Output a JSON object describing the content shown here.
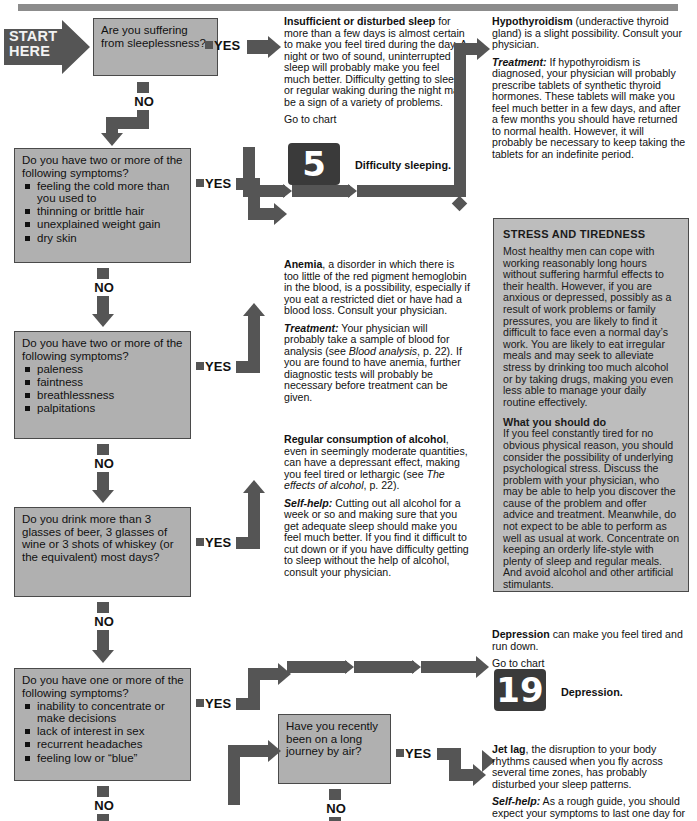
{
  "meta": {
    "chart_title": "Tiredness diagnostic flowchart",
    "start_label_line1": "START",
    "start_label_line2": "HERE",
    "yes_label": "YES",
    "no_label": "NO",
    "go_to_chart_label": "Go to chart"
  },
  "colors": {
    "box_fill": "#b0b0b0",
    "panel_fill": "#bdbdbd",
    "connector": "#555555",
    "badge_fill": "#3a3a3a",
    "text": "#111111"
  },
  "questions": [
    {
      "id": "q1",
      "title": "Are you suffering from sleeplessness?",
      "bullets": []
    },
    {
      "id": "q2",
      "title": "Do you have two or more of the following symptoms?",
      "bullets": [
        "feeling the cold more than you used to",
        "thinning or brittle hair",
        "unexplained weight gain",
        "dry skin"
      ]
    },
    {
      "id": "q3",
      "title": "Do you have two or more of the following symptoms?",
      "bullets": [
        "paleness",
        "faintness",
        "breathlessness",
        "palpitations"
      ]
    },
    {
      "id": "q4",
      "title": "Do you drink more than 3 glasses of beer, 3 glasses of wine or 3 shots of whiskey (or the equivalent) most days?",
      "bullets": []
    },
    {
      "id": "q5",
      "title": "Do you have one or more of the following symptoms?",
      "bullets": [
        "inability to concentrate or make decisions",
        "lack of interest in sex",
        "recurrent headaches",
        "feeling low or “blue”"
      ]
    },
    {
      "id": "q6",
      "title": "Have you recently been on a long journey by air?",
      "bullets": []
    }
  ],
  "answers": {
    "sleep": {
      "lead_bold": "Insufficient or disturbed sleep",
      "lead_rest": " for more than a few days is almost certain to make you feel tired during the day. A night or two of sound, uninterrupted sleep will probably make you feel much better. Difficulty getting to sleep or regular waking during the night may be a sign of a variety of problems.",
      "chart_number": "5",
      "chart_caption": "Difficulty sleeping."
    },
    "hypothyroidism": {
      "lead_bold": "Hypothyroidism",
      "lead_rest": " (underactive thyroid gland) is a slight possibility. Consult your physician.",
      "treatment_label": "Treatment:",
      "treatment_text": " If hypothyroidism is diagnosed, your physician will probably prescribe tablets of synthetic thyroid hormones. These tablets will make you feel much better in a few days, and after a few months you should have returned to normal health. However, it will probably be necessary to keep taking the tablets for an indefinite period."
    },
    "anemia": {
      "lead_bold": "Anemia",
      "lead_rest": ", a disorder in which there is too little of the red pigment hemoglobin in the blood, is a possibility, especially if you eat a restricted diet or have had a blood loss. Consult your physician.",
      "treatment_label": "Treatment:",
      "treatment_a": " Your physician will probably take a sample of blood for analysis (see ",
      "treatment_italic": "Blood analysis",
      "treatment_b": ", p. 22). If you are found to have anemia, further diagnostic tests will probably be necessary before treatment can be given."
    },
    "alcohol": {
      "lead_bold": "Regular consumption of alcohol",
      "lead_rest_a": ", even in seemingly moderate quantities, can have a depressant effect, making you feel tired or lethargic (see ",
      "lead_italic": "The effects of alcohol",
      "lead_rest_b": ", p. 22).",
      "selfhelp_label": "Self-help:",
      "selfhelp_text": " Cutting out all alcohol for a week or so and making sure that you get adequate sleep should make you feel much better. If you find it difficult to cut down or if you have difficulty getting to sleep without the help of alcohol, consult your physician."
    },
    "depression": {
      "lead_bold": "Depression",
      "lead_rest": " can make you feel tired and run down.",
      "chart_number": "19",
      "chart_caption": "Depression."
    },
    "jetlag": {
      "lead_bold": "Jet lag",
      "lead_rest": ", the disruption to your body rhythms caused when you fly across several time zones, has probably disturbed your sleep patterns.",
      "selfhelp_label": "Self-help:",
      "selfhelp_text": " As a rough guide, you should expect your symptoms to last one day for"
    }
  },
  "panel": {
    "heading": "STRESS AND TIREDNESS",
    "paragraph1": "Most healthy men can cope with working reasonably long hours without suffering harmful effects to their health. However, if you are anxious or depressed, possibly as a result of work problems or family pressures, you are likely to find it difficult to face even a normal day’s work. You are likely to eat irregular meals and may seek to alleviate stress by drinking too much alcohol or by taking drugs, making you even less able to manage your daily routine effectively.",
    "subheading": "What you should do",
    "paragraph2": "If you feel constantly tired for no obvious physical reason, you should consider the possibility of underlying psychological stress. Discuss the problem with your physician, who may be able to help you discover the cause of the problem and offer advice and treatment. Meanwhile, do not expect to be able to perform as well as usual at work. Concentrate on keeping an orderly life-style with plenty of sleep and regular meals. And avoid alcohol and other artificial stimulants."
  }
}
